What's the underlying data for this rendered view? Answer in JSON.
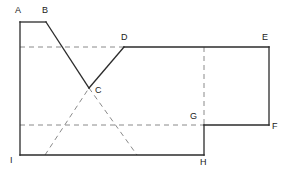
{
  "figure": {
    "kind": "geometry-polygon-diagram",
    "canvas": {
      "width": 286,
      "height": 173
    },
    "style": {
      "solid_stroke_color": "#2b2b2b",
      "dashed_stroke_color": "#8a8a8a",
      "background_color": "#ffffff",
      "label_color": "#1a1a1a",
      "solid_stroke_width": 1.3,
      "dashed_stroke_width": 1,
      "dash_pattern": "5,4"
    },
    "vertices": [
      {
        "id": "A",
        "label": "A",
        "x": 20,
        "y": 22,
        "label_x": 15,
        "label_y": 6
      },
      {
        "id": "B",
        "label": "B",
        "x": 46,
        "y": 22,
        "label_x": 42,
        "label_y": 6
      },
      {
        "id": "C",
        "label": "C",
        "x": 89,
        "y": 88,
        "label_x": 95,
        "label_y": 86
      },
      {
        "id": "D",
        "label": "D",
        "x": 124,
        "y": 47,
        "label_x": 121,
        "label_y": 33
      },
      {
        "id": "E",
        "label": "E",
        "x": 269,
        "y": 47,
        "label_x": 262,
        "label_y": 33
      },
      {
        "id": "F",
        "label": "F",
        "x": 269,
        "y": 125,
        "label_x": 272,
        "label_y": 122
      },
      {
        "id": "G",
        "label": "G",
        "x": 204,
        "y": 125,
        "label_x": 190,
        "label_y": 112
      },
      {
        "id": "H",
        "label": "H",
        "x": 204,
        "y": 155,
        "label_x": 200,
        "label_y": 158
      },
      {
        "id": "I",
        "label": "I",
        "x": 20,
        "y": 155,
        "label_x": 10,
        "label_y": 156
      }
    ],
    "outline_path": "M20,22 L46,22 L89,88 L124,47 L269,47 L269,125 L204,125 L204,155 L20,155 Z",
    "solid_edges": [
      {
        "name": "edge-A-B",
        "from": "A",
        "to": "B"
      },
      {
        "name": "edge-B-C",
        "from": "B",
        "to": "C"
      },
      {
        "name": "edge-C-D",
        "from": "C",
        "to": "D"
      },
      {
        "name": "edge-D-E",
        "from": "D",
        "to": "E"
      },
      {
        "name": "edge-E-F",
        "from": "E",
        "to": "F"
      },
      {
        "name": "edge-F-G",
        "from": "F",
        "to": "G"
      },
      {
        "name": "edge-G-H",
        "from": "G",
        "to": "H"
      },
      {
        "name": "edge-H-I",
        "from": "H",
        "to": "I"
      },
      {
        "name": "edge-I-A",
        "from": "I",
        "to": "A"
      }
    ],
    "dashed_lines": [
      {
        "name": "dashed-upper-horizontal",
        "x1": 20,
        "y1": 47,
        "x2": 124,
        "y2": 47
      },
      {
        "name": "dashed-lower-horizontal",
        "x1": 20,
        "y1": 125,
        "x2": 204,
        "y2": 125
      },
      {
        "name": "dashed-vertical-to-g",
        "x1": 204,
        "y1": 47,
        "x2": 204,
        "y2": 125
      },
      {
        "name": "dashed-diagonal-left",
        "x1": 45,
        "y1": 155,
        "x2": 89,
        "y2": 88
      },
      {
        "name": "dashed-diagonal-right",
        "x1": 89,
        "y1": 88,
        "x2": 137,
        "y2": 155
      }
    ]
  }
}
